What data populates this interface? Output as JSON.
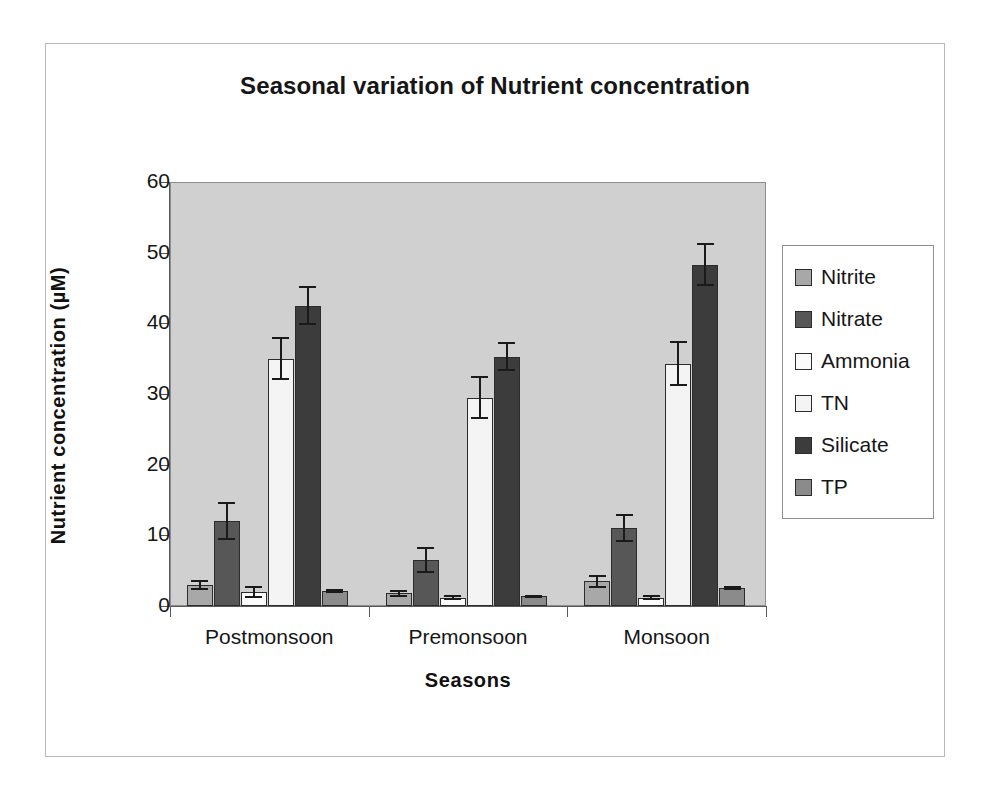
{
  "chart_data": {
    "type": "bar",
    "title": "Seasonal variation of Nutrient concentration",
    "xlabel": "Seasons",
    "ylabel": "Nutrient concentration (µM)",
    "categories": [
      "Postmonsoon",
      "Premonsoon",
      "Monsoon"
    ],
    "ylim": [
      0,
      60
    ],
    "yticks": [
      0,
      10,
      20,
      30,
      40,
      50,
      60
    ],
    "grid": false,
    "legend_position": "right",
    "series": [
      {
        "name": "Nitrite",
        "color": "#a8a8a8",
        "values": [
          3.0,
          1.8,
          3.5
        ],
        "errors": [
          0.7,
          0.5,
          0.9
        ]
      },
      {
        "name": "Nitrate",
        "color": "#575757",
        "values": [
          12.0,
          6.5,
          11.0
        ],
        "errors": [
          2.7,
          1.8,
          2.0
        ]
      },
      {
        "name": "Ammonia",
        "color": "#fbfbfb",
        "values": [
          2.0,
          1.2,
          1.2
        ],
        "errors": [
          0.8,
          0.4,
          0.4
        ]
      },
      {
        "name": "TN",
        "color": "#f4f4f4",
        "values": [
          35.0,
          29.5,
          34.3
        ],
        "errors": [
          3.0,
          3.0,
          3.2
        ]
      },
      {
        "name": "Silicate",
        "color": "#3c3c3c",
        "values": [
          42.5,
          35.3,
          48.3
        ],
        "errors": [
          2.8,
          2.0,
          3.0
        ]
      },
      {
        "name": "TP",
        "color": "#8b8b8b",
        "values": [
          2.1,
          1.4,
          2.5
        ],
        "errors": [
          0.3,
          0.2,
          0.3
        ]
      }
    ]
  },
  "colors": {
    "plot_background": "#d0d0d0",
    "page_background": "#ffffff",
    "axis": "#5a5a5a",
    "text": "#161616"
  }
}
